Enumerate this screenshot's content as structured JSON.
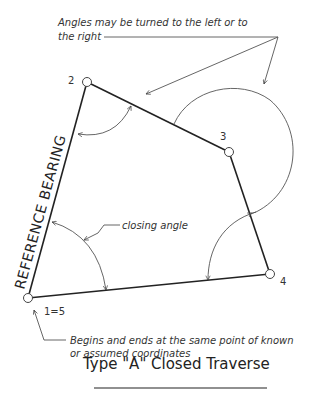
{
  "diagram": {
    "title": "Type \"A\" Closed Traverse",
    "annotations": {
      "angles_line1": "Angles may be turned to the left or to",
      "angles_line2": "the right",
      "closing_angle": "closing angle",
      "begins_line1": "Begins and ends at the same point of known",
      "begins_line2": "or assumed coordinates",
      "reference_bearing": "REFERENCE   BEARING"
    },
    "points": [
      {
        "label": "1=5",
        "x": 28,
        "y": 298
      },
      {
        "label": "2",
        "x": 87,
        "y": 82
      },
      {
        "label": "3",
        "x": 229,
        "y": 152
      },
      {
        "label": "4",
        "x": 270,
        "y": 274
      }
    ],
    "colors": {
      "line": "#222222",
      "arc": "#555555",
      "text": "#333333"
    }
  }
}
